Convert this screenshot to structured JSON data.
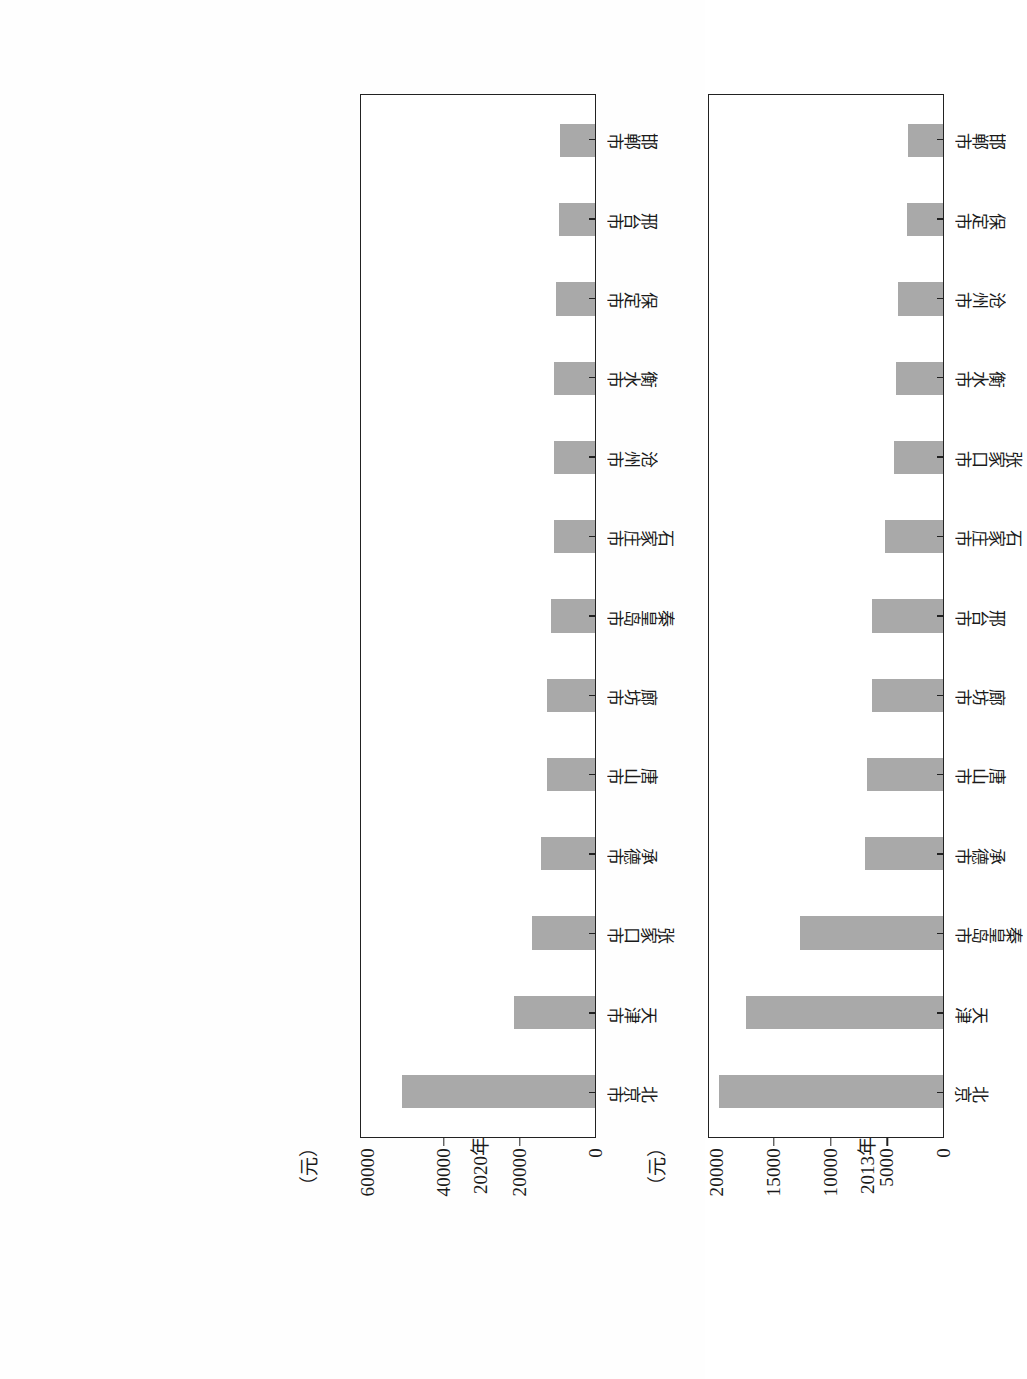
{
  "page": {
    "kind": "scanned-figure-page",
    "bar_color": "#a9a9a9",
    "axis_color": "#222222"
  },
  "chart_data": [
    {
      "id": "chart-2020",
      "type": "bar",
      "title": "",
      "xlabel": "2020年",
      "ylabel": "",
      "unit_label": "（元）",
      "ylim": [
        0,
        62000
      ],
      "yticks": [
        0,
        20000,
        40000,
        60000
      ],
      "ytick_labels": [
        "0",
        "20000",
        "40000",
        "60000"
      ],
      "grid": false,
      "legend": "none",
      "orientation": "vertical-bars-rotated-page",
      "categories": [
        "北京市",
        "天津市",
        "张家口市",
        "承德市",
        "唐山市",
        "廊坊市",
        "秦皇岛市",
        "石家庄市",
        "沧州市",
        "衡水市",
        "保定市",
        "邢台市",
        "邯郸市"
      ],
      "values": [
        51200,
        21500,
        16600,
        14300,
        12800,
        12800,
        11700,
        10900,
        10900,
        10900,
        10400,
        9500,
        9200
      ]
    },
    {
      "id": "chart-2013",
      "type": "bar",
      "title": "",
      "xlabel": "2013年",
      "ylabel": "",
      "unit_label": "（元）",
      "ylim": [
        0,
        20800
      ],
      "yticks": [
        0,
        5000,
        10000,
        15000,
        20000
      ],
      "ytick_labels": [
        "0",
        "5000",
        "10000",
        "15000",
        "20000"
      ],
      "grid": false,
      "legend": "none",
      "orientation": "vertical-bars-rotated-page",
      "categories": [
        "北京",
        "天津",
        "秦皇岛市",
        "承德市",
        "唐山市",
        "廊坊市",
        "邢台市",
        "石家庄市",
        "张家口市",
        "衡水市",
        "沧州市",
        "保定市",
        "邯郸市"
      ],
      "values": [
        19900,
        17500,
        12700,
        6900,
        6800,
        6300,
        6300,
        5200,
        4400,
        4200,
        4000,
        3200,
        3100
      ]
    }
  ]
}
